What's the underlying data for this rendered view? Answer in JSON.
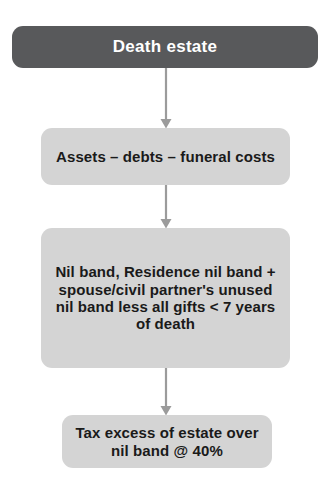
{
  "diagram": {
    "colors": {
      "dark_box": "#58595B",
      "light_box": "#D4D4D4",
      "dark_box_text": "#FFFFFF",
      "light_box_text": "#1A1A1A",
      "connector": "#9B9B9B",
      "background": "#FFFFFF"
    },
    "nodes": [
      {
        "id": "death-estate",
        "label": "Death estate",
        "style": "dark"
      },
      {
        "id": "assets-debts-funeral",
        "label": "Assets – debts – funeral costs",
        "style": "light"
      },
      {
        "id": "nil-band-calculation",
        "label": "Nil band, Residence nil band + spouse/civil partner's unused nil band less all gifts < 7 years of death",
        "style": "light"
      },
      {
        "id": "tax-excess",
        "label": "Tax excess of estate over nil band @ 40%",
        "style": "light"
      }
    ],
    "connectors": [
      {
        "id": "arrow-1",
        "from": "death-estate",
        "to": "assets-debts-funeral",
        "icon": "arrow-down-icon"
      },
      {
        "id": "arrow-2",
        "from": "assets-debts-funeral",
        "to": "nil-band-calculation",
        "icon": "arrow-down-icon"
      },
      {
        "id": "arrow-3",
        "from": "nil-band-calculation",
        "to": "tax-excess",
        "icon": "arrow-down-icon"
      }
    ]
  }
}
